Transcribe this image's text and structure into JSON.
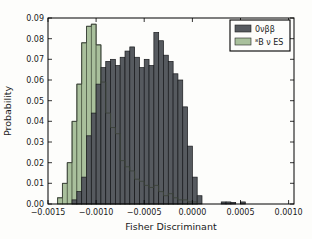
{
  "figure": {
    "background": "#fdfdfb",
    "plot_background": "#fdfdfb",
    "axis_color": "#000000"
  },
  "chart_data": {
    "type": "bar",
    "subtype": "histogram",
    "title": "",
    "xlabel": "Fisher Discriminant",
    "ylabel": "Probability",
    "xlim": [
      -0.0015,
      0.001056
    ],
    "ylim": [
      0,
      0.09
    ],
    "grid": false,
    "legend_position": "upper right",
    "bin_width": 5e-05,
    "xticks": {
      "values": [
        -0.0015,
        -0.001,
        -0.0005,
        0.0,
        0.0005,
        0.001
      ],
      "labels": [
        "−0.0015",
        "−0.0010",
        "−0.0005",
        "0.0000",
        "0.0005",
        "0.0010"
      ]
    },
    "yticks": {
      "values": [
        0.0,
        0.01,
        0.02,
        0.03,
        0.04,
        0.05,
        0.06,
        0.07,
        0.08,
        0.09
      ],
      "labels": [
        "0.00",
        "0.01",
        "0.02",
        "0.03",
        "0.04",
        "0.05",
        "0.06",
        "0.07",
        "0.08",
        "0.09"
      ]
    },
    "series": [
      {
        "name": "⁸B ν ES",
        "role": "background-histogram",
        "fill": "#a9c09c",
        "edge": "#47533f",
        "outline_on_top": true,
        "outline_color": "#3c433a",
        "bin_start": -0.0014,
        "values": [
          0.003,
          0.01,
          0.02,
          0.04,
          0.058,
          0.078,
          0.086,
          0.087,
          0.077,
          0.059,
          0.044,
          0.037,
          0.034,
          0.021,
          0.018,
          0.016,
          0.012,
          0.011,
          0.009,
          0.008,
          0.009,
          0.006,
          0.004,
          0.005,
          0.003,
          0.002,
          0.002,
          0.001,
          0.001
        ]
      },
      {
        "name": "0νββ",
        "role": "foreground-histogram",
        "fill": "#565a5f",
        "edge": "#17191c",
        "outline_on_top": false,
        "bin_start": -0.00125,
        "values": [
          0.002,
          0.006,
          0.013,
          0.033,
          0.044,
          0.058,
          0.066,
          0.069,
          0.07,
          0.067,
          0.071,
          0.074,
          0.076,
          0.071,
          0.066,
          0.07,
          0.067,
          0.083,
          0.079,
          0.072,
          0.069,
          0.063,
          0.06,
          0.047,
          0.028,
          0.013,
          0.004,
          0,
          0,
          0,
          0,
          0.001,
          0.001,
          0.0008,
          0,
          0.001
        ]
      }
    ],
    "legend": {
      "items": [
        {
          "label": "0νββ",
          "swatch_color": "#565a5f"
        },
        {
          "label": "⁸B ν ES",
          "swatch_color": "#a9c09c"
        }
      ]
    }
  }
}
